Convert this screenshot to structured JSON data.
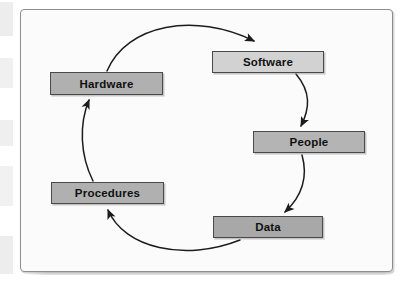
{
  "figure": {
    "frame": {
      "background": "#fbfbfb",
      "border_color": "#8d8d8d"
    }
  },
  "diagram": {
    "type": "cycle",
    "direction": "clockwise",
    "nodes": [
      {
        "id": "software",
        "label": "Software",
        "fill": "#d2d2d2",
        "border": "#4a4a4a",
        "x": 212,
        "y": 51,
        "w": 112,
        "h": 22
      },
      {
        "id": "people",
        "label": "People",
        "fill": "#b4b4b4",
        "border": "#4a4a4a",
        "x": 253,
        "y": 131,
        "w": 112,
        "h": 22
      },
      {
        "id": "data",
        "label": "Data",
        "fill": "#a8a8a8",
        "border": "#4a4a4a",
        "x": 213,
        "y": 216,
        "w": 110,
        "h": 22
      },
      {
        "id": "procedures",
        "label": "Procedures",
        "fill": "#b0b0b0",
        "border": "#4a4a4a",
        "x": 51,
        "y": 182,
        "w": 113,
        "h": 22
      },
      {
        "id": "hardware",
        "label": "Hardware",
        "fill": "#b0b0b0",
        "border": "#4a4a4a",
        "x": 50,
        "y": 72,
        "w": 113,
        "h": 23
      }
    ],
    "edges": [
      {
        "id": "hardware-to-software",
        "from": "Hardware",
        "to": "Software",
        "style": "curved-arrow"
      },
      {
        "id": "software-to-people",
        "from": "Software",
        "to": "People",
        "style": "curved-arrow"
      },
      {
        "id": "people-to-data",
        "from": "People",
        "to": "Data",
        "style": "curved-arrow"
      },
      {
        "id": "data-to-procedures",
        "from": "Data",
        "to": "Procedures",
        "style": "curved-arrow"
      },
      {
        "id": "procedures-to-hardware",
        "from": "Procedures",
        "to": "Hardware",
        "style": "curved-arrow"
      }
    ],
    "line_color": "#1c1c1c"
  }
}
